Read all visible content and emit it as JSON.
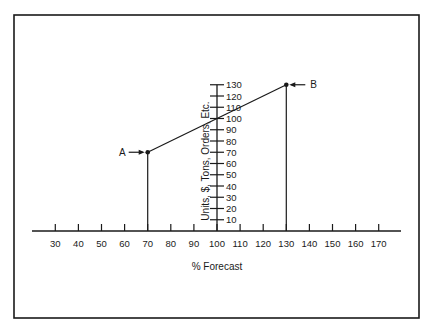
{
  "chart_data": {
    "type": "line",
    "title": "",
    "xlabel": "% Forecast",
    "ylabel": "Units, $, Tons, Orders, Etc.",
    "x_ticks": [
      30,
      40,
      50,
      60,
      70,
      80,
      90,
      100,
      110,
      120,
      130,
      140,
      150,
      160,
      170
    ],
    "y_ticks": [
      10,
      20,
      30,
      40,
      50,
      60,
      70,
      80,
      90,
      100,
      110,
      120,
      130
    ],
    "xlim": [
      20,
      180
    ],
    "ylim": [
      0,
      130
    ],
    "grid": false,
    "legend": null,
    "series": [
      {
        "name": "Forecast line",
        "x": [
          70,
          130
        ],
        "y": [
          70,
          130
        ]
      }
    ],
    "annotations": [
      {
        "label": "A",
        "x": 70,
        "y": 70,
        "arrow": "from-left"
      },
      {
        "label": "B",
        "x": 130,
        "y": 130,
        "arrow": "from-right"
      }
    ],
    "drop_lines": [
      {
        "x": 70,
        "from_y": 0,
        "to_y": 70
      },
      {
        "x": 130,
        "from_y": 0,
        "to_y": 130
      }
    ]
  },
  "colors": {
    "ink": "#1a1a1a",
    "background": "#ffffff"
  }
}
